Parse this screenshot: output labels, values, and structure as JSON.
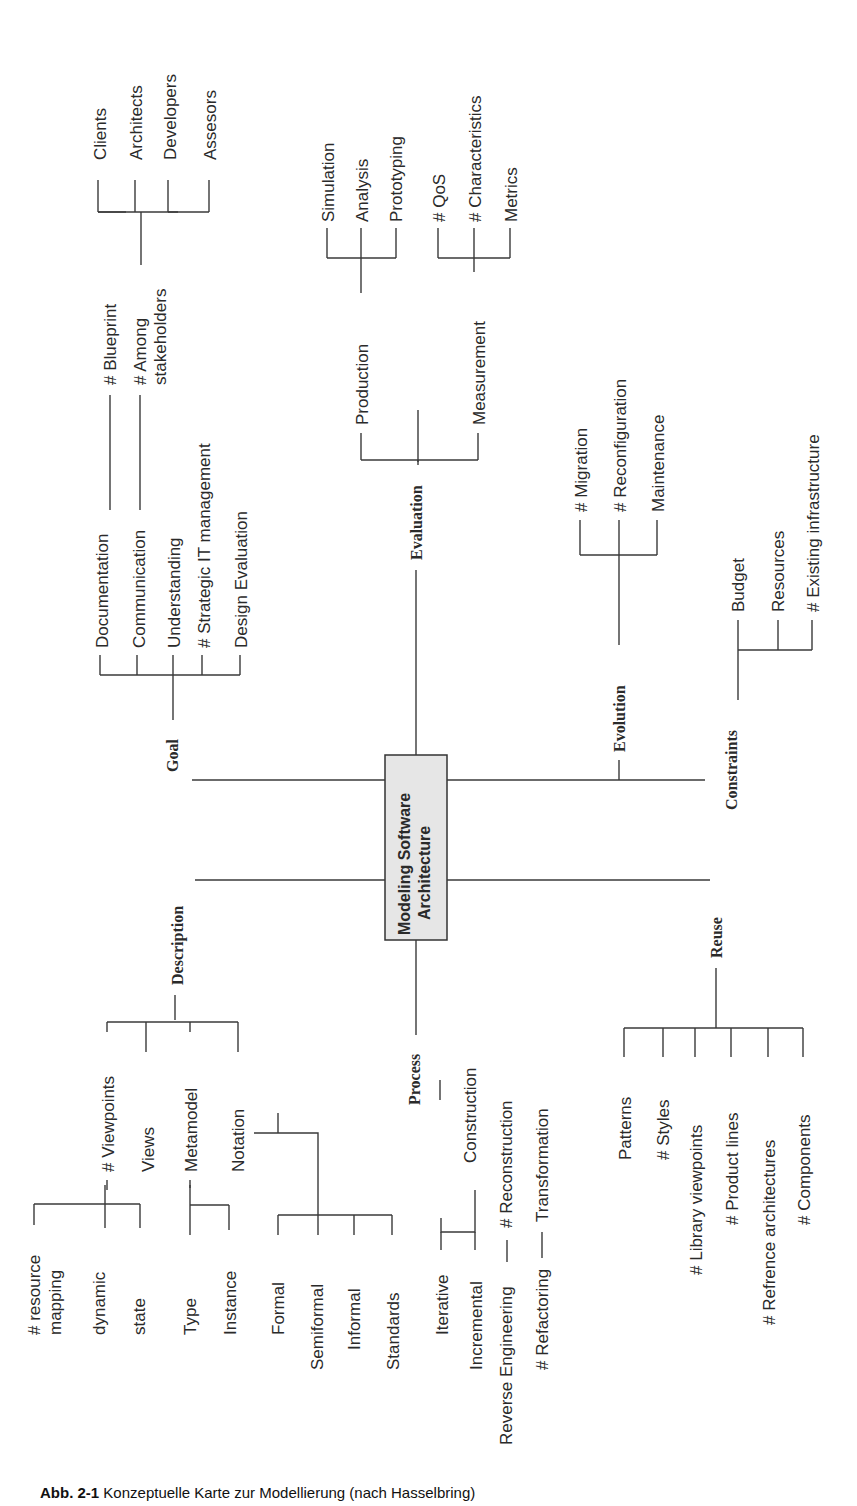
{
  "diagram": {
    "title": "Modeling Software Architecture",
    "center_line1": "Modeling Software",
    "center_line2": "Architecture",
    "center_fill": "#e6e6e6",
    "orientation": "rotated 90deg counter-clockwise",
    "branches": {
      "goal": {
        "label": "Goal",
        "children": {
          "documentation": "Documentation",
          "communication": "Communication",
          "understanding": "Understanding",
          "strategic_it": "# Strategic IT management",
          "design_eval": "Design Evaluation",
          "blueprint": "# Blueprint",
          "among_1": "# Among",
          "among_2": "stakeholders",
          "clients": "Clients",
          "architects": "Architects",
          "developers": "Developers",
          "assessors": "Assesors"
        }
      },
      "evaluation": {
        "label": "Evaluation",
        "children": {
          "production": "Production",
          "measurement": "Measurement",
          "simulation": "Simulation",
          "analysis": "Analysis",
          "prototyping": "Prototyping",
          "qos": "# QoS",
          "characteristics": "# Characteristics",
          "metrics": "Metrics"
        }
      },
      "evolution": {
        "label": "Evolution",
        "children": {
          "migration": "# Migration",
          "reconfiguration": "# Reconfiguration",
          "maintenance": "Maintenance"
        }
      },
      "constraints": {
        "label": "Constraints",
        "children": {
          "budget": "Budget",
          "resources": "Resources",
          "existing_infra": "# Existing infrastructure"
        }
      },
      "description": {
        "label": "Description",
        "children": {
          "viewpoints": "# Viewpoints",
          "views": "Views",
          "metamodel": "Metamodel",
          "notation": "Notation",
          "resource_1": "# resource",
          "resource_2": "mapping",
          "dynamic": "dynamic",
          "state": "state",
          "type": "Type",
          "instance": "Instance",
          "formal": "Formal",
          "semiformal": "Semiformal",
          "informal": "Informal",
          "standards": "Standards"
        }
      },
      "process": {
        "label": "Process",
        "children": {
          "construction": "Construction",
          "iterative": "Iterative",
          "incremental": "Incremental",
          "reverse_eng": "Reverse Engineering",
          "reconstruction": "# Reconstruction",
          "refactoring": "# Refactoring",
          "transformation": "Transformation"
        }
      },
      "reuse": {
        "label": "Reuse",
        "children": {
          "patterns": "Patterns",
          "styles": "# Styles",
          "library_viewpoints": "# Library viewpoints",
          "product_lines": "# Product lines",
          "refence_arch": "# Refrence architectures",
          "components": "# Components"
        }
      }
    }
  },
  "caption": {
    "number": "Abb. 2-1",
    "text": "Konzeptuelle Karte zur Modellierung (nach Hasselbring)"
  }
}
